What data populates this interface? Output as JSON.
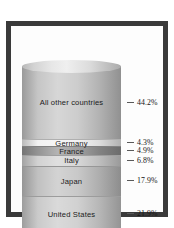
{
  "chart_data": {
    "type": "bar",
    "orientation": "stacked-vertical-cylinder",
    "title": "",
    "xlabel": "",
    "ylabel": "",
    "unit": "%",
    "categories": [
      "All other countries",
      "Germany",
      "France",
      "Italy",
      "Japan",
      "United States"
    ],
    "values": [
      44.2,
      4.3,
      4.9,
      6.8,
      17.9,
      21.9
    ],
    "value_labels": [
      "44.2%",
      "4.3%",
      "4.9%",
      "6.8%",
      "17.9%",
      "21.9%"
    ],
    "ylim": [
      0,
      100
    ],
    "grid": false,
    "legend": "none",
    "segment_colors": [
      "#c2c2c2",
      "#f1f1f1",
      "#8d8d8d",
      "#cfcfcf",
      "#bdbdbd",
      "#c7c7c7"
    ]
  },
  "figure": {
    "frame_color": "#3a3a3a",
    "background_color": "#ffffff",
    "tick_color": "#5a5a5a"
  },
  "segments": [
    {
      "label": "All other countries",
      "value_label": "44.2%",
      "tone": "tone-a"
    },
    {
      "label": "Germany",
      "value_label": "4.3%",
      "tone": "tone-b"
    },
    {
      "label": "France",
      "value_label": "4.9%",
      "tone": "tone-c"
    },
    {
      "label": "Italy",
      "value_label": "6.8%",
      "tone": "tone-d"
    },
    {
      "label": "Japan",
      "value_label": "17.9%",
      "tone": "tone-e"
    },
    {
      "label": "United States",
      "value_label": "21.9%",
      "tone": "tone-f"
    }
  ]
}
